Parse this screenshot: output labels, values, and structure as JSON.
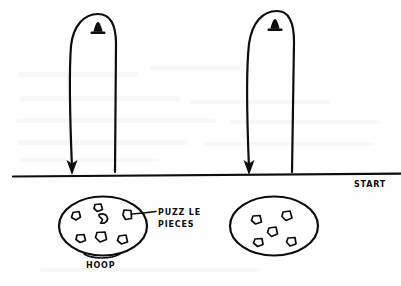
{
  "diagram": {
    "ink_color": "#0d0d0d",
    "background_color": "#fefefe",
    "labels": {
      "start": "START",
      "hoop": "HOOP",
      "puzzle_line1": "PUZZ LE",
      "puzzle_line2": "PIECES"
    },
    "start_line": {
      "label": "START",
      "y": 176,
      "x_start": 13,
      "x_end": 401
    },
    "lanes": [
      {
        "name": "lane-left",
        "marker": "cone-icon",
        "marker_x": 98,
        "marker_y": 31,
        "down_leg_x": 72,
        "up_leg_x": 115,
        "arrow_direction": "down",
        "arrow_tip_y": 174,
        "turn_top_y": 14
      },
      {
        "name": "lane-right",
        "marker": "cone-icon",
        "marker_x": 275,
        "marker_y": 28,
        "down_leg_x": 249,
        "up_leg_x": 292,
        "arrow_direction": "down",
        "arrow_tip_y": 174,
        "turn_top_y": 11
      }
    ],
    "hoops": [
      {
        "name": "hoop-left",
        "label": "HOOP",
        "cx": 103,
        "cy": 226,
        "rx": 44,
        "ry": 30,
        "piece_count": 7,
        "callout_label": "PUZZ LE PIECES"
      },
      {
        "name": "hoop-right",
        "label": "",
        "cx": 274,
        "cy": 226,
        "rx": 44,
        "ry": 30,
        "piece_count": 5,
        "callout_label": ""
      }
    ],
    "callout": {
      "text_line1": "PUZZ LE",
      "text_line2": "PIECES",
      "text_x": 158,
      "text_y1": 213,
      "text_y2": 224,
      "leader_from_x": 133,
      "leader_from_y": 214,
      "leader_to_x": 155,
      "leader_to_y": 211
    }
  }
}
